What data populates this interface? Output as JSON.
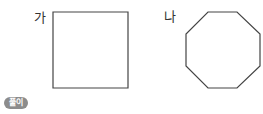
{
  "figures": [
    {
      "id": "ga",
      "label": "가",
      "shape": "square",
      "points": [
        [
          53,
          12
        ],
        [
          128,
          12
        ],
        [
          128,
          88
        ],
        [
          53,
          88
        ]
      ]
    },
    {
      "id": "na",
      "label": "나",
      "shape": "regular-octagon",
      "points": [
        [
          208,
          12
        ],
        [
          237,
          12
        ],
        [
          260,
          34
        ],
        [
          260,
          66
        ],
        [
          237,
          88
        ],
        [
          208,
          88
        ],
        [
          186,
          66
        ],
        [
          186,
          34
        ]
      ]
    }
  ],
  "stroke_color": "#444444",
  "badge": {
    "label": "풀이",
    "color": "#8c8c8c"
  }
}
